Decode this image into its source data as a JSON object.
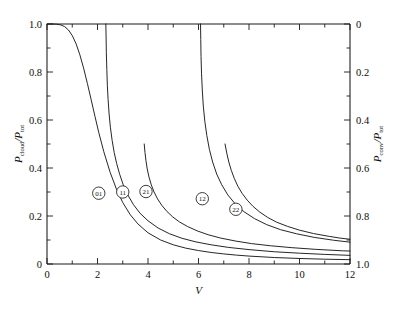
{
  "chart_data": {
    "type": "line",
    "title": "",
    "xlabel": "V",
    "ylabel_left_num": "P",
    "ylabel_left_num_sub": "cloud",
    "ylabel_left_den": "P",
    "ylabel_left_den_sub": "tot",
    "ylabel_right_num": "P",
    "ylabel_right_num_sub": "conv",
    "ylabel_right_den": "P",
    "ylabel_right_den_sub": "tot",
    "xlim": [
      0,
      12
    ],
    "ylim_left": [
      0,
      1.0
    ],
    "ylim_right_top": 0,
    "ylim_right_bottom": 1.0,
    "grid": false,
    "legend_position": "inline-badges",
    "xticks": [
      0,
      2,
      4,
      6,
      8,
      10,
      12
    ],
    "xticklabels": [
      "0",
      "2",
      "4",
      "6",
      "8",
      "10",
      "12"
    ],
    "xminor_step": 1,
    "yticks_left": [
      0,
      0.2,
      0.4,
      0.6,
      0.8,
      1.0
    ],
    "yticklabels_left": [
      "0",
      "0.2",
      "0.4",
      "0.6",
      "0.8",
      "1.0"
    ],
    "yticks_right": [
      0,
      0.2,
      0.4,
      0.6,
      0.8,
      1.0
    ],
    "yticklabels_right": [
      "0",
      "0.2",
      "0.4",
      "0.6",
      "0.8",
      "1.0"
    ],
    "yminor_step": 0.1,
    "series": [
      {
        "name": "01",
        "label": "01",
        "badge_x": 2.05,
        "badge_y": 0.295,
        "points": [
          [
            0.0,
            1.0
          ],
          [
            0.2,
            1.0
          ],
          [
            0.4,
            0.999
          ],
          [
            0.55,
            0.996
          ],
          [
            0.7,
            0.989
          ],
          [
            0.85,
            0.975
          ],
          [
            1.0,
            0.952
          ],
          [
            1.15,
            0.918
          ],
          [
            1.3,
            0.872
          ],
          [
            1.45,
            0.816
          ],
          [
            1.6,
            0.752
          ],
          [
            1.75,
            0.684
          ],
          [
            1.9,
            0.615
          ],
          [
            2.05,
            0.548
          ],
          [
            2.25,
            0.468
          ],
          [
            2.5,
            0.382
          ],
          [
            2.75,
            0.312
          ],
          [
            3.0,
            0.256
          ],
          [
            3.3,
            0.205
          ],
          [
            3.6,
            0.167
          ],
          [
            4.0,
            0.13
          ],
          [
            4.5,
            0.1
          ],
          [
            5.0,
            0.08
          ],
          [
            5.5,
            0.066
          ],
          [
            6.0,
            0.056
          ],
          [
            6.5,
            0.048
          ],
          [
            7.0,
            0.042
          ],
          [
            7.5,
            0.037
          ],
          [
            8.0,
            0.033
          ],
          [
            9.0,
            0.027
          ],
          [
            10.0,
            0.023
          ],
          [
            11.0,
            0.02
          ],
          [
            12.0,
            0.018
          ]
        ]
      },
      {
        "name": "11",
        "label": "11",
        "badge_x": 3.0,
        "badge_y": 0.3,
        "points": [
          [
            2.33,
            1.0
          ],
          [
            2.34,
            0.95
          ],
          [
            2.35,
            0.88
          ],
          [
            2.37,
            0.81
          ],
          [
            2.39,
            0.745
          ],
          [
            2.42,
            0.685
          ],
          [
            2.46,
            0.625
          ],
          [
            2.51,
            0.57
          ],
          [
            2.58,
            0.515
          ],
          [
            2.66,
            0.465
          ],
          [
            2.76,
            0.418
          ],
          [
            2.88,
            0.373
          ],
          [
            3.02,
            0.33
          ],
          [
            3.2,
            0.288
          ],
          [
            3.42,
            0.248
          ],
          [
            3.68,
            0.212
          ],
          [
            4.0,
            0.18
          ],
          [
            4.4,
            0.15
          ],
          [
            4.85,
            0.126
          ],
          [
            5.35,
            0.107
          ],
          [
            5.9,
            0.092
          ],
          [
            6.5,
            0.08
          ],
          [
            7.2,
            0.069
          ],
          [
            8.0,
            0.06
          ],
          [
            9.0,
            0.051
          ],
          [
            10.0,
            0.045
          ],
          [
            11.0,
            0.04
          ],
          [
            12.0,
            0.036
          ]
        ]
      },
      {
        "name": "21",
        "label": "21",
        "badge_x": 3.92,
        "badge_y": 0.302,
        "points": [
          [
            3.85,
            0.5
          ],
          [
            3.88,
            0.465
          ],
          [
            3.92,
            0.43
          ],
          [
            3.97,
            0.396
          ],
          [
            4.04,
            0.362
          ],
          [
            4.13,
            0.33
          ],
          [
            4.24,
            0.3
          ],
          [
            4.38,
            0.271
          ],
          [
            4.55,
            0.244
          ],
          [
            4.75,
            0.219
          ],
          [
            4.98,
            0.196
          ],
          [
            5.25,
            0.175
          ],
          [
            5.57,
            0.156
          ],
          [
            5.95,
            0.138
          ],
          [
            6.38,
            0.122
          ],
          [
            6.88,
            0.108
          ],
          [
            7.45,
            0.096
          ],
          [
            8.1,
            0.085
          ],
          [
            8.85,
            0.076
          ],
          [
            9.7,
            0.068
          ],
          [
            10.65,
            0.061
          ],
          [
            11.7,
            0.055
          ],
          [
            12.0,
            0.054
          ]
        ]
      },
      {
        "name": "12",
        "label": "12",
        "badge_x": 6.15,
        "badge_y": 0.272,
        "points": [
          [
            6.08,
            1.0
          ],
          [
            6.09,
            0.935
          ],
          [
            6.1,
            0.865
          ],
          [
            6.12,
            0.795
          ],
          [
            6.15,
            0.725
          ],
          [
            6.19,
            0.658
          ],
          [
            6.25,
            0.595
          ],
          [
            6.33,
            0.535
          ],
          [
            6.43,
            0.478
          ],
          [
            6.56,
            0.425
          ],
          [
            6.72,
            0.375
          ],
          [
            6.92,
            0.33
          ],
          [
            7.16,
            0.288
          ],
          [
            7.45,
            0.251
          ],
          [
            7.8,
            0.218
          ],
          [
            8.22,
            0.189
          ],
          [
            8.7,
            0.164
          ],
          [
            9.25,
            0.143
          ],
          [
            9.88,
            0.126
          ],
          [
            10.58,
            0.111
          ],
          [
            11.35,
            0.099
          ],
          [
            12.0,
            0.091
          ]
        ]
      },
      {
        "name": "22",
        "label": "22",
        "badge_x": 7.48,
        "badge_y": 0.228,
        "points": [
          [
            7.05,
            0.5
          ],
          [
            7.12,
            0.462
          ],
          [
            7.2,
            0.425
          ],
          [
            7.3,
            0.39
          ],
          [
            7.42,
            0.356
          ],
          [
            7.56,
            0.324
          ],
          [
            7.73,
            0.294
          ],
          [
            7.93,
            0.266
          ],
          [
            8.16,
            0.24
          ],
          [
            8.43,
            0.216
          ],
          [
            8.74,
            0.194
          ],
          [
            9.1,
            0.174
          ],
          [
            9.52,
            0.157
          ],
          [
            10.0,
            0.141
          ],
          [
            10.55,
            0.127
          ],
          [
            11.18,
            0.115
          ],
          [
            11.6,
            0.108
          ],
          [
            12.0,
            0.103
          ]
        ]
      }
    ]
  }
}
